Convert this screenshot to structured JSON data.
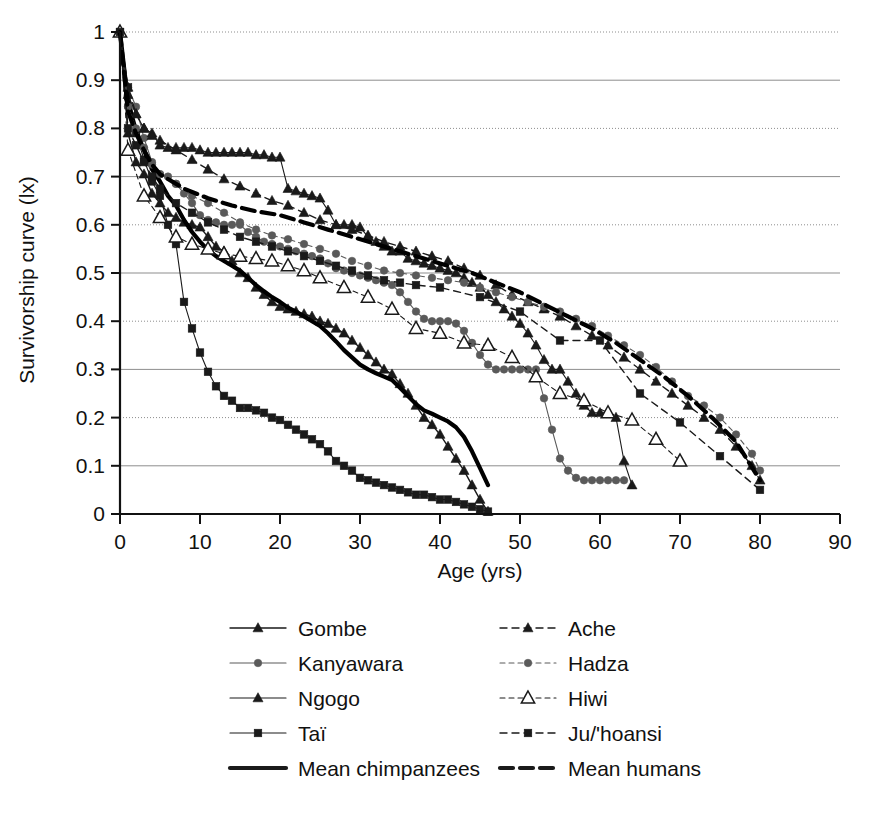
{
  "chart_data": {
    "type": "line",
    "title": "",
    "xlabel": "Age (yrs)",
    "ylabel": "Survivorship curve (lx)",
    "xlim": [
      0,
      90
    ],
    "ylim": [
      0,
      1
    ],
    "xticks": [
      0,
      10,
      20,
      30,
      40,
      50,
      60,
      70,
      80,
      90
    ],
    "yticks": [
      "0",
      "0.1",
      "0.2",
      "0.3",
      "0.4",
      "0.5",
      "0.6",
      "0.7",
      "0.8",
      "0.9",
      "1"
    ],
    "grid": true,
    "grid_axis": "y",
    "legend_position": "below",
    "series": [
      {
        "name": "Gombe",
        "group": "chimpanzee",
        "marker": "triangle-filled",
        "line": "solid",
        "color": "#1a1a1a",
        "x": [
          0,
          1,
          2,
          3,
          4,
          5,
          6,
          7,
          8,
          9,
          10,
          11,
          12,
          13,
          14,
          15,
          16,
          17,
          18,
          19,
          20,
          21,
          22,
          23,
          24,
          25,
          26,
          27,
          28,
          29,
          30,
          31,
          32,
          33,
          34,
          35,
          36,
          37,
          38,
          39,
          40,
          41,
          42,
          43,
          44,
          45,
          46
        ],
        "y": [
          1.0,
          0.79,
          0.73,
          0.705,
          0.665,
          0.645,
          0.625,
          0.615,
          0.605,
          0.6,
          0.595,
          0.575,
          0.555,
          0.545,
          0.525,
          0.5,
          0.49,
          0.47,
          0.455,
          0.44,
          0.43,
          0.425,
          0.42,
          0.415,
          0.41,
          0.4,
          0.395,
          0.385,
          0.375,
          0.36,
          0.345,
          0.33,
          0.315,
          0.3,
          0.29,
          0.27,
          0.25,
          0.225,
          0.2,
          0.185,
          0.165,
          0.14,
          0.115,
          0.09,
          0.06,
          0.03,
          0.005
        ]
      },
      {
        "name": "Kanyawara",
        "group": "chimpanzee",
        "marker": "circle-filled",
        "line": "solid-thin",
        "color": "#5a5a5a",
        "x": [
          0,
          1,
          2,
          3,
          4,
          5,
          6,
          7,
          8,
          9,
          10,
          11,
          12,
          13,
          14,
          15,
          16,
          17,
          18,
          19,
          20,
          21,
          22,
          23,
          24,
          25,
          26,
          27,
          28,
          29,
          30,
          31,
          32,
          33,
          34,
          35,
          36,
          37,
          38,
          39,
          40,
          41,
          42,
          43,
          44,
          45,
          46,
          47,
          48,
          49,
          50,
          51,
          52,
          53,
          54,
          55,
          56,
          57,
          58,
          59,
          60,
          61,
          62,
          63
        ],
        "y": [
          1.0,
          0.885,
          0.845,
          0.78,
          0.73,
          0.705,
          0.7,
          0.685,
          0.665,
          0.645,
          0.62,
          0.61,
          0.605,
          0.6,
          0.6,
          0.6,
          0.585,
          0.575,
          0.565,
          0.56,
          0.555,
          0.55,
          0.545,
          0.54,
          0.535,
          0.53,
          0.52,
          0.51,
          0.505,
          0.5,
          0.495,
          0.49,
          0.485,
          0.48,
          0.475,
          0.46,
          0.44,
          0.42,
          0.405,
          0.4,
          0.4,
          0.4,
          0.395,
          0.38,
          0.355,
          0.33,
          0.31,
          0.3,
          0.3,
          0.3,
          0.3,
          0.3,
          0.3,
          0.24,
          0.175,
          0.115,
          0.09,
          0.075,
          0.07,
          0.07,
          0.07,
          0.07,
          0.07,
          0.07
        ]
      },
      {
        "name": "Ngogo",
        "group": "chimpanzee",
        "marker": "triangle-filled",
        "line": "solid-thin",
        "color": "#1a1a1a",
        "x": [
          0,
          1,
          2,
          3,
          4,
          5,
          6,
          7,
          8,
          9,
          10,
          11,
          12,
          13,
          14,
          15,
          16,
          17,
          18,
          19,
          20,
          21,
          22,
          23,
          24,
          25,
          26,
          27,
          28,
          29,
          30,
          31,
          32,
          33,
          34,
          35,
          36,
          37,
          38,
          39,
          40,
          41,
          42,
          43,
          44,
          45,
          46,
          47,
          48,
          49,
          50,
          51,
          52,
          53,
          54,
          55,
          56,
          57,
          58,
          59,
          60,
          61,
          62,
          63,
          64
        ],
        "y": [
          1.0,
          0.87,
          0.83,
          0.8,
          0.79,
          0.765,
          0.76,
          0.76,
          0.76,
          0.76,
          0.755,
          0.75,
          0.75,
          0.75,
          0.75,
          0.75,
          0.75,
          0.745,
          0.745,
          0.74,
          0.74,
          0.675,
          0.67,
          0.665,
          0.66,
          0.655,
          0.63,
          0.6,
          0.6,
          0.6,
          0.595,
          0.575,
          0.565,
          0.555,
          0.545,
          0.545,
          0.53,
          0.525,
          0.52,
          0.515,
          0.51,
          0.505,
          0.5,
          0.49,
          0.48,
          0.47,
          0.455,
          0.44,
          0.425,
          0.41,
          0.395,
          0.375,
          0.35,
          0.32,
          0.3,
          0.3,
          0.275,
          0.25,
          0.225,
          0.21,
          0.21,
          0.21,
          0.2,
          0.11,
          0.06
        ]
      },
      {
        "name": "Taï",
        "group": "chimpanzee",
        "marker": "square-filled",
        "line": "solid-thin",
        "color": "#1a1a1a",
        "x": [
          0,
          1,
          2,
          3,
          4,
          5,
          6,
          7,
          8,
          9,
          10,
          11,
          12,
          13,
          14,
          15,
          16,
          17,
          18,
          19,
          20,
          21,
          22,
          23,
          24,
          25,
          26,
          27,
          28,
          29,
          30,
          31,
          32,
          33,
          34,
          35,
          36,
          37,
          38,
          39,
          40,
          41,
          42,
          43,
          44,
          45,
          46
        ],
        "y": [
          1.0,
          0.885,
          0.79,
          0.735,
          0.69,
          0.66,
          0.6,
          0.56,
          0.44,
          0.385,
          0.335,
          0.295,
          0.265,
          0.245,
          0.235,
          0.22,
          0.22,
          0.215,
          0.21,
          0.2,
          0.195,
          0.185,
          0.175,
          0.165,
          0.155,
          0.145,
          0.13,
          0.11,
          0.1,
          0.09,
          0.075,
          0.07,
          0.065,
          0.06,
          0.055,
          0.05,
          0.045,
          0.04,
          0.04,
          0.035,
          0.03,
          0.03,
          0.025,
          0.02,
          0.015,
          0.01,
          0.005
        ]
      },
      {
        "name": "Mean chimpanzees",
        "group": "chimpanzee",
        "marker": "none",
        "line": "solid-thick",
        "color": "#000000",
        "x": [
          0,
          1,
          2,
          3,
          4,
          5,
          6,
          7,
          8,
          9,
          10,
          11,
          12,
          13,
          14,
          15,
          16,
          17,
          18,
          19,
          20,
          21,
          22,
          23,
          24,
          25,
          26,
          27,
          28,
          29,
          30,
          31,
          32,
          33,
          34,
          35,
          36,
          37,
          38,
          39,
          40,
          41,
          42,
          43,
          44,
          45,
          46
        ],
        "y": [
          1.0,
          0.855,
          0.795,
          0.755,
          0.715,
          0.69,
          0.66,
          0.64,
          0.61,
          0.585,
          0.565,
          0.548,
          0.535,
          0.525,
          0.515,
          0.505,
          0.49,
          0.475,
          0.462,
          0.45,
          0.44,
          0.428,
          0.42,
          0.41,
          0.4,
          0.39,
          0.375,
          0.358,
          0.34,
          0.325,
          0.31,
          0.3,
          0.292,
          0.285,
          0.278,
          0.262,
          0.245,
          0.228,
          0.215,
          0.208,
          0.2,
          0.192,
          0.18,
          0.16,
          0.13,
          0.095,
          0.06
        ]
      },
      {
        "name": "Ache",
        "group": "human",
        "marker": "triangle-filled",
        "line": "dashed",
        "color": "#1a1a1a",
        "x": [
          0,
          1,
          2,
          3,
          4,
          5,
          7,
          9,
          11,
          13,
          15,
          17,
          19,
          21,
          23,
          25,
          27,
          29,
          31,
          33,
          35,
          37,
          39,
          41,
          43,
          45,
          47,
          49,
          51,
          53,
          55,
          57,
          59,
          61,
          63,
          65,
          67,
          69,
          71,
          73,
          75,
          77,
          79,
          80
        ],
        "y": [
          1.0,
          0.885,
          0.83,
          0.8,
          0.785,
          0.775,
          0.755,
          0.735,
          0.715,
          0.695,
          0.68,
          0.665,
          0.65,
          0.64,
          0.625,
          0.61,
          0.6,
          0.59,
          0.578,
          0.565,
          0.555,
          0.545,
          0.535,
          0.525,
          0.51,
          0.495,
          0.475,
          0.455,
          0.44,
          0.425,
          0.41,
          0.39,
          0.37,
          0.35,
          0.325,
          0.3,
          0.275,
          0.25,
          0.225,
          0.2,
          0.175,
          0.14,
          0.1,
          0.07
        ]
      },
      {
        "name": "Hadza",
        "group": "human",
        "marker": "circle-filled",
        "line": "dashed-thin",
        "color": "#5a5a5a",
        "x": [
          0,
          1,
          2,
          3,
          4,
          5,
          7,
          9,
          11,
          13,
          15,
          17,
          19,
          21,
          23,
          25,
          27,
          29,
          31,
          33,
          35,
          37,
          39,
          41,
          43,
          45,
          47,
          49,
          51,
          53,
          55,
          57,
          59,
          61,
          63,
          65,
          67,
          69,
          71,
          73,
          75,
          77,
          79,
          80
        ],
        "y": [
          1.0,
          0.845,
          0.8,
          0.76,
          0.725,
          0.705,
          0.685,
          0.66,
          0.645,
          0.625,
          0.605,
          0.59,
          0.578,
          0.57,
          0.56,
          0.55,
          0.54,
          0.525,
          0.515,
          0.505,
          0.5,
          0.495,
          0.49,
          0.485,
          0.48,
          0.47,
          0.46,
          0.45,
          0.44,
          0.43,
          0.42,
          0.405,
          0.39,
          0.37,
          0.35,
          0.33,
          0.305,
          0.275,
          0.245,
          0.225,
          0.2,
          0.165,
          0.125,
          0.09
        ]
      },
      {
        "name": "Hiwi",
        "group": "human",
        "marker": "triangle-open",
        "line": "dashed-thin",
        "color": "#1a1a1a",
        "x": [
          0,
          1,
          3,
          5,
          7,
          9,
          11,
          13,
          15,
          17,
          19,
          21,
          23,
          25,
          28,
          31,
          34,
          37,
          40,
          43,
          46,
          49,
          52,
          55,
          58,
          61,
          64,
          67,
          70
        ],
        "y": [
          1.0,
          0.755,
          0.66,
          0.615,
          0.575,
          0.56,
          0.55,
          0.54,
          0.535,
          0.53,
          0.525,
          0.515,
          0.505,
          0.49,
          0.47,
          0.45,
          0.425,
          0.385,
          0.375,
          0.355,
          0.35,
          0.325,
          0.285,
          0.25,
          0.235,
          0.21,
          0.195,
          0.155,
          0.11
        ]
      },
      {
        "name": "Ju/'hoansi",
        "group": "human",
        "marker": "square-filled",
        "line": "dashed",
        "color": "#1a1a1a",
        "x": [
          0,
          1,
          2,
          3,
          4,
          5,
          7,
          9,
          11,
          13,
          15,
          17,
          19,
          21,
          23,
          25,
          27,
          29,
          31,
          33,
          35,
          37,
          40,
          45,
          50,
          55,
          60,
          65,
          70,
          75,
          80
        ],
        "y": [
          1.0,
          0.8,
          0.765,
          0.73,
          0.7,
          0.675,
          0.645,
          0.625,
          0.605,
          0.59,
          0.575,
          0.565,
          0.555,
          0.545,
          0.535,
          0.525,
          0.515,
          0.505,
          0.495,
          0.485,
          0.48,
          0.475,
          0.47,
          0.45,
          0.42,
          0.36,
          0.36,
          0.25,
          0.19,
          0.12,
          0.05
        ]
      },
      {
        "name": "Mean humans",
        "group": "human",
        "marker": "none",
        "line": "dashed-thick",
        "color": "#000000",
        "x": [
          0,
          1,
          2,
          3,
          4,
          5,
          8,
          11,
          14,
          17,
          20,
          23,
          26,
          29,
          32,
          35,
          38,
          41,
          44,
          47,
          50,
          53,
          56,
          59,
          62,
          65,
          68,
          71,
          74,
          77,
          80
        ],
        "y": [
          1.0,
          0.835,
          0.79,
          0.755,
          0.725,
          0.705,
          0.675,
          0.655,
          0.64,
          0.628,
          0.62,
          0.605,
          0.59,
          0.575,
          0.56,
          0.545,
          0.53,
          0.515,
          0.5,
          0.48,
          0.46,
          0.435,
          0.41,
          0.385,
          0.355,
          0.32,
          0.285,
          0.245,
          0.2,
          0.15,
          0.07
        ]
      }
    ],
    "legend": {
      "column_left": [
        {
          "label": "Gombe",
          "marker": "triangle-filled",
          "line": "solid"
        },
        {
          "label": "Kanyawara",
          "marker": "circle-filled",
          "line": "solid-thin"
        },
        {
          "label": "Ngogo",
          "marker": "triangle-filled",
          "line": "solid-thin"
        },
        {
          "label": "Taï",
          "marker": "square-filled",
          "line": "solid-thin"
        },
        {
          "label": "Mean chimpanzees",
          "marker": "none",
          "line": "solid-thick"
        }
      ],
      "column_right": [
        {
          "label": "Ache",
          "marker": "triangle-filled",
          "line": "dashed"
        },
        {
          "label": "Hadza",
          "marker": "circle-filled",
          "line": "dashed-thin"
        },
        {
          "label": "Hiwi",
          "marker": "triangle-open",
          "line": "dashed-thin"
        },
        {
          "label": "Ju/'hoansi",
          "marker": "square-filled",
          "line": "dashed"
        },
        {
          "label": "Mean humans",
          "marker": "none",
          "line": "dashed-thick"
        }
      ]
    }
  }
}
